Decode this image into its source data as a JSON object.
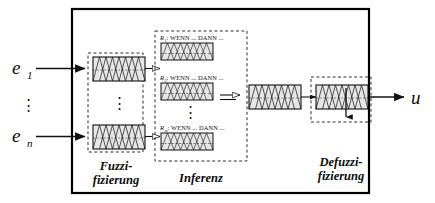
{
  "diagram": {
    "colors": {
      "stroke": "#111111",
      "outer_border": "#000000",
      "dashed_border": "#1a1a1a",
      "mf_fill": "#cccccc",
      "box_fill": "#e8e8e8",
      "background": "#ffffff"
    },
    "inputs": [
      {
        "name": "input-e1",
        "label": "e",
        "subscript": "1"
      },
      {
        "name": "input-en",
        "label": "e",
        "subscript": "n"
      }
    ],
    "input_ellipsis": "⋮",
    "output": {
      "name": "output-u",
      "label": "u"
    },
    "stages": [
      {
        "id": "fuzzification",
        "line1": "Fuzzi-",
        "line2": "fizierung"
      },
      {
        "id": "inference",
        "line1": "Inferenz",
        "line2": ""
      },
      {
        "id": "defuzzification",
        "line1": "Defuzzi-",
        "line2": "fizierung"
      }
    ],
    "rules": [
      {
        "id": "R",
        "subscript": "1",
        "text": ": WENN ... DANN ..."
      },
      {
        "id": "R",
        "subscript": "2",
        "text": ": WENN ... DANN ..."
      },
      {
        "id": "R",
        "subscript": "m",
        "text": ": WENN ... DANN ..."
      }
    ],
    "rule_ellipsis": "⋮",
    "blocks": {
      "fuzzification_mf_boxes": 2,
      "inference_rule_boxes": 3,
      "aggregation_boxes": 1,
      "defuzzification_boxes": 1
    }
  }
}
